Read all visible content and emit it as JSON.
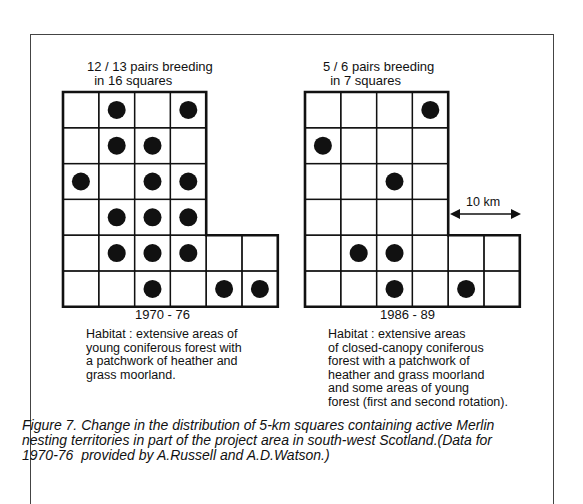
{
  "figure": {
    "left_panel": {
      "title": "12 / 13 pairs breeding\n  in 16 squares",
      "period": "1970 - 76",
      "habitat": "Habitat : extensive areas of\nyoung coniferous forest with\na patchwork of heather and\ngrass moorland.",
      "occupied_squares": [
        [
          0,
          1
        ],
        [
          0,
          3
        ],
        [
          1,
          1
        ],
        [
          1,
          2
        ],
        [
          2,
          0
        ],
        [
          2,
          2
        ],
        [
          2,
          3
        ],
        [
          3,
          1
        ],
        [
          3,
          2
        ],
        [
          3,
          3
        ],
        [
          4,
          1
        ],
        [
          4,
          2
        ],
        [
          4,
          3
        ],
        [
          5,
          2
        ],
        [
          5,
          4
        ],
        [
          5,
          5
        ]
      ]
    },
    "right_panel": {
      "title": "5 / 6 pairs breeding\n  in 7 squares",
      "period": "1986 - 89",
      "habitat": "Habitat : extensive areas\nof closed-canopy coniferous\nforest with a patchwork of\nheather and grass moorland\nand some areas of young\nforest (first and second rotation).",
      "occupied_squares": [
        [
          0,
          3
        ],
        [
          1,
          0
        ],
        [
          2,
          2
        ],
        [
          4,
          1
        ],
        [
          4,
          2
        ],
        [
          5,
          2
        ],
        [
          5,
          4
        ]
      ],
      "scale_label": "10 km"
    },
    "grid_shape": {
      "rows": 6,
      "upper_rows_cols": 4,
      "lower_rows_cols": 6,
      "widen_at_row": 4
    },
    "caption": "Figure 7. Change in the distribution of 5-km squares containing active Merlin\nnesting territories in part of the project area in south-west Scotland.(Data for\n1970-76  provided by A.Russell and A.D.Watson.)",
    "colors": {
      "ink": "#111111",
      "paper": "#ffffff",
      "frame": "#444444"
    }
  }
}
